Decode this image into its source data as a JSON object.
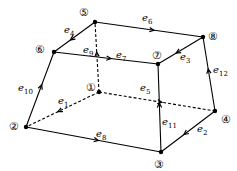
{
  "nodes": [
    {
      "id": "1",
      "label": "①",
      "x": 99,
      "y": 92,
      "lx": 86,
      "ly": 82
    },
    {
      "id": "2",
      "label": "②",
      "x": 26,
      "y": 127,
      "lx": 9,
      "ly": 121
    },
    {
      "id": "3",
      "label": "③",
      "x": 161,
      "y": 152,
      "lx": 154,
      "ly": 159
    },
    {
      "id": "4",
      "label": "④",
      "x": 215,
      "y": 111,
      "lx": 221,
      "ly": 114
    },
    {
      "id": "5",
      "label": "⑤",
      "x": 95,
      "y": 22,
      "lx": 79,
      "ly": 7
    },
    {
      "id": "6",
      "label": "⑥",
      "x": 54,
      "y": 52,
      "lx": 35,
      "ly": 44
    },
    {
      "id": "7",
      "label": "⑦",
      "x": 158,
      "y": 64,
      "lx": 152,
      "ly": 50
    },
    {
      "id": "8",
      "label": "⑧",
      "x": 203,
      "y": 37,
      "lx": 208,
      "ly": 31
    }
  ],
  "edges": [
    {
      "name": "e",
      "sub": "1",
      "from": "1",
      "to": "2",
      "dashed": true,
      "lx": 58,
      "ly": 96
    },
    {
      "name": "e",
      "sub": "2",
      "from": "4",
      "to": "3",
      "dashed": false,
      "lx": 197,
      "ly": 124
    },
    {
      "name": "e",
      "sub": "3",
      "from": "8",
      "to": "7",
      "dashed": false,
      "lx": 180,
      "ly": 52
    },
    {
      "name": "e",
      "sub": "4",
      "from": "5",
      "to": "6",
      "dashed": false,
      "lx": 64,
      "ly": 25
    },
    {
      "name": "e",
      "sub": "5",
      "from": "1",
      "to": "4",
      "dashed": true,
      "lx": 140,
      "ly": 83
    },
    {
      "name": "e",
      "sub": "6",
      "from": "5",
      "to": "8",
      "dashed": false,
      "lx": 142,
      "ly": 13
    },
    {
      "name": "e",
      "sub": "7",
      "from": "6",
      "to": "7",
      "dashed": false,
      "lx": 116,
      "ly": 50
    },
    {
      "name": "e",
      "sub": "8",
      "from": "2",
      "to": "3",
      "dashed": false,
      "lx": 96,
      "ly": 129
    },
    {
      "name": "e",
      "sub": "9",
      "from": "1",
      "to": "5",
      "dashed": true,
      "lx": 83,
      "ly": 45
    },
    {
      "name": "e",
      "sub": "10",
      "from": "2",
      "to": "6",
      "dashed": false,
      "lx": 18,
      "ly": 83
    },
    {
      "name": "e",
      "sub": "11",
      "from": "3",
      "to": "7",
      "dashed": false,
      "lx": 162,
      "ly": 117
    },
    {
      "name": "e",
      "sub": "12",
      "from": "4",
      "to": "8",
      "dashed": false,
      "lx": 213,
      "ly": 65
    }
  ]
}
